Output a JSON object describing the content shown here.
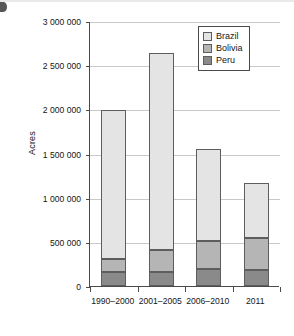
{
  "chart_data": {
    "type": "bar",
    "subtype": "stacked-bar",
    "title": "",
    "subtitle": "",
    "xlabel": "",
    "ylabel": "Acres",
    "categories": [
      "1990–2000",
      "2001–2005",
      "2006–2010",
      "2011"
    ],
    "series": [
      {
        "name": "Peru",
        "color": "#8a8a8a",
        "values": [
          160000,
          160000,
          190000,
          185000
        ]
      },
      {
        "name": "Bolivia",
        "color": "#b5b5b5",
        "values": [
          150000,
          245000,
          315000,
          355000
        ]
      },
      {
        "name": "Brazil",
        "color": "#e4e4e4",
        "values": [
          1680000,
          2230000,
          1045000,
          630000
        ]
      }
    ],
    "stack_order_bottom_to_top": [
      "Peru",
      "Bolivia",
      "Brazil"
    ],
    "totals": [
      1990000,
      2635000,
      1550000,
      1170000
    ],
    "ylim": [
      0,
      3000000
    ],
    "ytick_values": [
      0,
      500000,
      1000000,
      1500000,
      2000000,
      2500000,
      3000000
    ],
    "ytick_labels": [
      "0",
      "500 000",
      "1 000 000",
      "1 500 000",
      "2 000 000",
      "2 500 000",
      "3 000 000"
    ],
    "grid": true,
    "grid_axis": "y",
    "legend_position": "top-right",
    "legend_entries": [
      "Brazil",
      "Bolivia",
      "Peru"
    ],
    "annotations": []
  },
  "legend": {
    "items": [
      {
        "label": "Brazil",
        "swatch": "#e4e4e4"
      },
      {
        "label": "Bolivia",
        "swatch": "#b5b5b5"
      },
      {
        "label": "Peru",
        "swatch": "#8a8a8a"
      }
    ]
  },
  "axes": {
    "y_title": "Acres",
    "y_ticks": [
      "3 000 000",
      "2 500 000",
      "2 000 000",
      "1 500 000",
      "1 000 000",
      "500 000",
      "0"
    ],
    "x_ticks": [
      "1990–2000",
      "2001–2005",
      "2006–2010",
      "2011"
    ]
  },
  "colors": {
    "brazil": "#e4e4e4",
    "bolivia": "#b5b5b5",
    "peru": "#8a8a8a",
    "axis": "#4a4a4a",
    "grid": "#c9c9c9",
    "text": "#161616",
    "background": "#ffffff"
  }
}
